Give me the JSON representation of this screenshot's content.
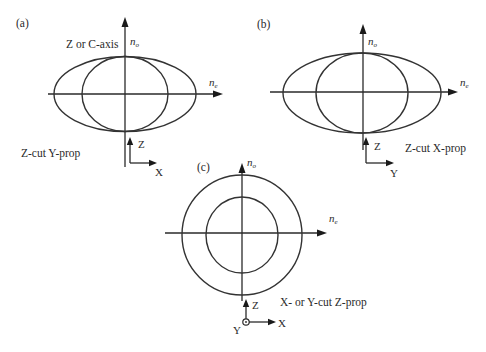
{
  "figure": {
    "colors": {
      "line": "#2a2a2a",
      "background": "#ffffff"
    }
  },
  "panels": [
    {
      "id": "a",
      "tag": "(a)",
      "axis_label": "Z or C-axis",
      "vertical_axis": {
        "symbol": "n",
        "subscript": "o"
      },
      "horizontal_axis": {
        "symbol": "n",
        "subscript": "e"
      },
      "shapes": [
        "ellipse (n_e horizontal > n_o vertical)",
        "circle (radius n_o)"
      ],
      "caption": "Z-cut Y-prop",
      "coords": {
        "up": "Z",
        "right": "X"
      }
    },
    {
      "id": "b",
      "tag": "(b)",
      "vertical_axis": {
        "symbol": "n",
        "subscript": "o"
      },
      "horizontal_axis": {
        "symbol": "n",
        "subscript": "e"
      },
      "shapes": [
        "ellipse (n_e horizontal > n_o vertical)",
        "circle (radius n_o)"
      ],
      "caption": "Z-cut X-prop",
      "coords": {
        "up": "Z",
        "right": "Y"
      }
    },
    {
      "id": "c",
      "tag": "(c)",
      "vertical_axis": {
        "symbol": "n",
        "subscript": "o"
      },
      "horizontal_axis": {
        "symbol": "n",
        "subscript": "e"
      },
      "shapes": [
        "outer circle",
        "inner circle"
      ],
      "caption": "X- or Y-cut Z-prop",
      "coords": {
        "up": "Z",
        "right": "X",
        "out_of_page": "Y"
      }
    }
  ]
}
